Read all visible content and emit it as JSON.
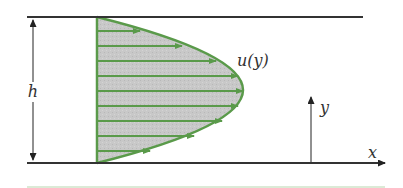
{
  "diagram": {
    "labels": {
      "height": "h",
      "velocity": "u(y)",
      "y_axis": "y",
      "x_axis": "x"
    },
    "colors": {
      "plate": "#333333",
      "profile_stroke": "#5a9a4a",
      "profile_fill": "#c6c6c6",
      "arrow": "#5a9a4a",
      "text": "#333333",
      "bottom_rule": "#cfe3c8"
    },
    "profile": {
      "shape": "parabolic",
      "arrow_count": 10
    }
  }
}
